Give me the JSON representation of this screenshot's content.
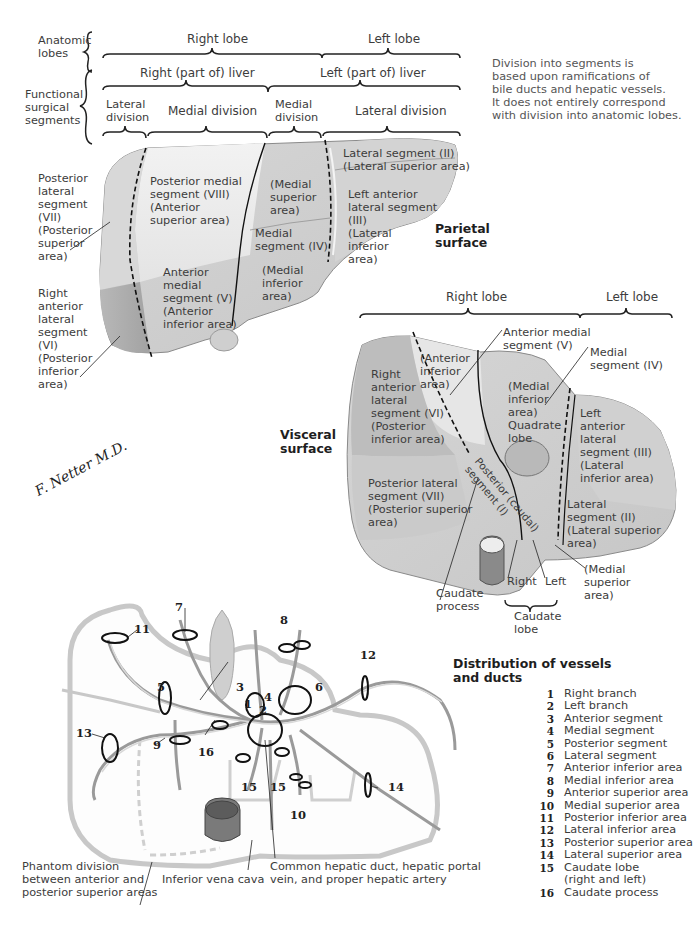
{
  "top_header": {
    "anatomic_lobes_label": "Anatomic\nlobes",
    "functional_label": "Functional\nsurgical\nsegments",
    "right_lobe": "Right lobe",
    "left_lobe": "Left lobe",
    "right_part_liver": "Right (part of) liver",
    "left_part_liver": "Left (part of) liver",
    "lateral_division_right": "Lateral\ndivision",
    "medial_division_right": "Medial division",
    "medial_division_left": "Medial\ndivision",
    "lateral_division_left": "Lateral division"
  },
  "note": "Division into segments is\nbased upon ramifications of\nbile ducts and hepatic vessels.\nIt does not entirely correspond\nwith division into anatomic lobes.",
  "parietal": {
    "title": "Parietal\nsurface",
    "left_labels": {
      "posterior_lateral": "Posterior\nlateral\nsegment\n(VII)\n(Posterior\nsuperior\narea)",
      "right_anterior_lateral": "Right\nanterior\nlateral\nsegment\n(VI)\n(Posterior\ninferior\narea)"
    },
    "segments": {
      "posterior_medial": "Posterior medial\nsegment (VIII)\n(Anterior\nsuperior area)",
      "medial_superior": "(Medial\nsuperior\narea)",
      "medial_segment": "Medial\nsegment (IV)",
      "medial_inferior": "(Medial\ninferior\narea)",
      "anterior_medial": "Anterior\nmedial\nsegment (V)\n(Anterior\ninferior area)",
      "lateral_segment": "Lateral segment (II)\n(Lateral superior area)",
      "left_anterior_lateral": "Left anterior\nlateral segment\n(III)\n(Lateral\ninferior\narea)"
    }
  },
  "visceral": {
    "title": "Visceral\nsurface",
    "right_lobe": "Right lobe",
    "left_lobe": "Left lobe",
    "callouts": {
      "anterior_medial": "Anterior medial\nsegment (V)",
      "medial_segment": "Medial\nsegment (IV)",
      "caudate_process": "Caudate\nprocess",
      "right": "Right",
      "left": "Left",
      "caudate_lobe": "Caudate\nlobe",
      "medial_superior": "(Medial\nsuperior\narea)"
    },
    "segments": {
      "anterior_inferior": "(Anterior\ninferior\narea)",
      "right_anterior_lateral": "Right\nanterior\nlateral\nsegment (VI)\n(Posterior\ninferior area)",
      "medial_inferior": "(Medial\ninferior\narea)\nQuadrate\nlobe",
      "left_anterior_lateral": "Left\nanterior\nlateral\nsegment (III)\n(Lateral\ninferior area)",
      "posterior_lateral": "Posterior lateral\nsegment (VII)\n(Posterior superior\n   area)",
      "lateral_segment": "Lateral\nsegment (II)\n(Lateral superior\n       area)",
      "posterior_caudal": "Posterior (caudal)\nsegment (I)"
    }
  },
  "vessels": {
    "title": "Distribution of vessels\nand ducts",
    "number_labels": [
      "1",
      "2",
      "3",
      "4",
      "5",
      "6",
      "7",
      "8",
      "9",
      "10",
      "11",
      "12",
      "13",
      "14",
      "15",
      "15",
      "16"
    ],
    "legend": [
      {
        "num": "1",
        "text": "Right branch"
      },
      {
        "num": "2",
        "text": "Left branch"
      },
      {
        "num": "3",
        "text": "Anterior segment"
      },
      {
        "num": "4",
        "text": "Medial segment"
      },
      {
        "num": "5",
        "text": "Posterior segment"
      },
      {
        "num": "6",
        "text": "Lateral segment"
      },
      {
        "num": "7",
        "text": "Anterior inferior area"
      },
      {
        "num": "8",
        "text": "Medial inferior area"
      },
      {
        "num": "9",
        "text": "Anterior superior area"
      },
      {
        "num": "10",
        "text": "Medial superior area"
      },
      {
        "num": "11",
        "text": "Posterior inferior area"
      },
      {
        "num": "12",
        "text": "Lateral inferior area"
      },
      {
        "num": "13",
        "text": "Posterior superior area"
      },
      {
        "num": "14",
        "text": "Lateral superior area"
      },
      {
        "num": "15",
        "text": "Caudate lobe\n(right and left)"
      },
      {
        "num": "16",
        "text": "Caudate process"
      }
    ],
    "bottom_labels": {
      "phantom": "Phantom division\nbetween anterior and\nposterior superior areas",
      "ivc": "Inferior vena cava",
      "common": "Common hepatic duct, hepatic portal\nvein, and  proper hepatic artery"
    }
  },
  "signature": "F. Netter M.D.",
  "colors": {
    "liver_light": "#e9e9e9",
    "liver_mid": "#cfcfcf",
    "liver_dark": "#a9a9a9",
    "outline": "#222222"
  }
}
